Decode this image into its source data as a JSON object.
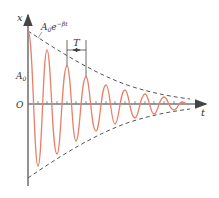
{
  "diagram": {
    "axes": {
      "y_label": "x",
      "x_label": "t",
      "origin_label": "O"
    },
    "labels": {
      "envelope_A": "A",
      "envelope_sub": "0",
      "envelope_e": "e",
      "envelope_exp": "−βt",
      "amplitude_A": "A",
      "amplitude_sub": "0",
      "period": "T"
    },
    "colors": {
      "curve": "#e8806a",
      "axis": "#555555",
      "envelope": "#555555"
    }
  }
}
